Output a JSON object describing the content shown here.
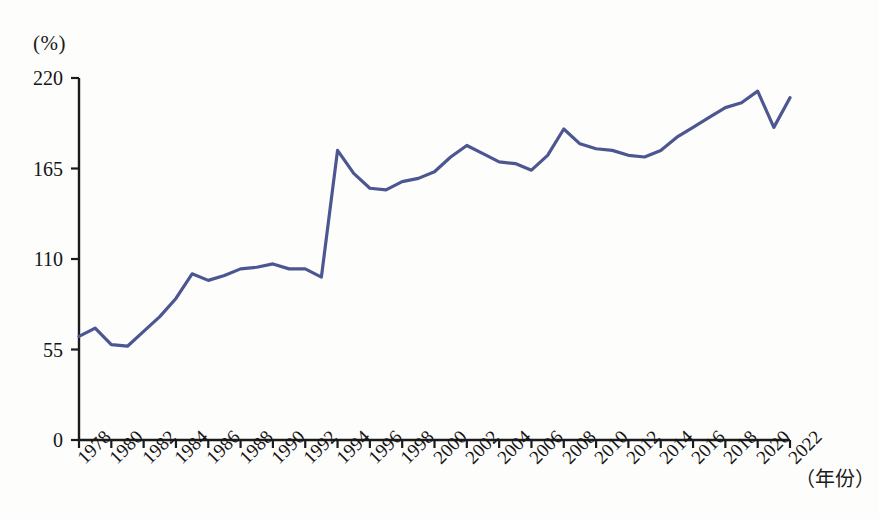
{
  "chart_data": {
    "type": "line",
    "title": "",
    "xlabel": "（年份）",
    "ylabel": "(%)",
    "ylim": [
      0,
      220
    ],
    "yticks": [
      0,
      55,
      110,
      165,
      220
    ],
    "ytick_labels": [
      "0",
      "55",
      "110",
      "165",
      "220"
    ],
    "grid": false,
    "legend": "none",
    "x": [
      1978,
      1979,
      1980,
      1981,
      1982,
      1983,
      1984,
      1985,
      1986,
      1987,
      1988,
      1989,
      1990,
      1991,
      1992,
      1993,
      1994,
      1995,
      1996,
      1997,
      1998,
      1999,
      2000,
      2001,
      2002,
      2003,
      2004,
      2005,
      2006,
      2007,
      2008,
      2009,
      2010,
      2011,
      2012,
      2013,
      2014,
      2015,
      2016,
      2017,
      2018,
      2019,
      2020,
      2021,
      2022
    ],
    "xtick_labels": [
      "1978",
      "1980",
      "1982",
      "1984",
      "1986",
      "1988",
      "1990",
      "1992",
      "1994",
      "1996",
      "1998",
      "2000",
      "2002",
      "2004",
      "2006",
      "2008",
      "2010",
      "2012",
      "2014",
      "2016",
      "2018",
      "2020",
      "2022"
    ],
    "xtick_values": [
      1978,
      1980,
      1982,
      1984,
      1986,
      1988,
      1990,
      1992,
      1994,
      1996,
      1998,
      2000,
      2002,
      2004,
      2006,
      2008,
      2010,
      2012,
      2014,
      2016,
      2018,
      2020,
      2022
    ],
    "series": [
      {
        "name": "",
        "color": "#4c5691",
        "values": [
          63,
          68,
          58,
          57,
          66,
          75,
          86,
          101,
          97,
          100,
          104,
          105,
          107,
          104,
          104,
          99,
          176,
          162,
          153,
          152,
          157,
          159,
          163,
          172,
          179,
          174,
          169,
          168,
          164,
          173,
          189,
          180,
          177,
          176,
          173,
          172,
          176,
          184,
          190,
          196,
          202,
          205,
          212,
          190,
          208
        ]
      }
    ]
  },
  "axes": {
    "unit_label": "(%)",
    "x_axis_title": "（年份）"
  }
}
